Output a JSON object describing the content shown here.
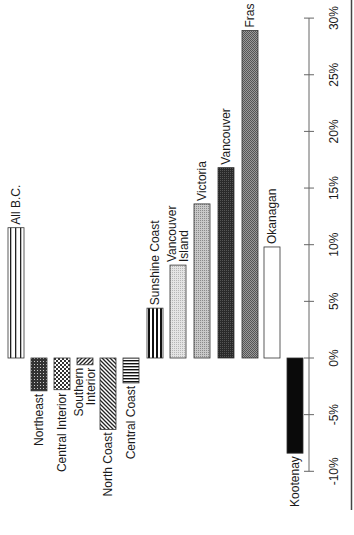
{
  "chart_data": {
    "type": "bar",
    "orientation": "rotated-90-ccw",
    "title": "",
    "xlabel": "",
    "ylabel": "",
    "ylim": [
      -10,
      30
    ],
    "grid": false,
    "legend": "none (bars labeled directly)",
    "yticks": [
      "-10%",
      "-5%",
      "0%",
      "5%",
      "10%",
      "15%",
      "20%",
      "25%",
      "30%"
    ],
    "categories": [
      "All B.C.",
      "Northeast",
      "Central Interior",
      "Southern Interior",
      "North Coast",
      "Central Coast",
      "Sunshine Coast",
      "Vancouver Island",
      "Victoria",
      "Vancouver",
      "Fras",
      "Okanagan",
      "Kootenay"
    ],
    "values": [
      11.5,
      -2.9,
      -2.8,
      -0.6,
      -6.3,
      -2.2,
      4.4,
      8.2,
      13.6,
      16.8,
      28.9,
      9.8,
      -8.4
    ]
  },
  "bars": [
    {
      "label": "All B.C.",
      "lines": [
        "All B.C."
      ],
      "value": 11.5,
      "x": 8,
      "pattern": "vstripes-wide"
    },
    {
      "label": "Northeast",
      "lines": [
        "Northeast"
      ],
      "value": -2.9,
      "x": 31,
      "pattern": "dense-dots"
    },
    {
      "label": "Central Interior",
      "lines": [
        "Central Interior"
      ],
      "value": -2.8,
      "x": 54,
      "pattern": "checker"
    },
    {
      "label": "Southern Interior",
      "lines": [
        "Southern",
        "Interior"
      ],
      "value": -0.6,
      "x": 77,
      "pattern": "diag-right"
    },
    {
      "label": "North Coast",
      "lines": [
        "North Coast"
      ],
      "value": -6.3,
      "x": 100,
      "pattern": "diag-left"
    },
    {
      "label": "Central Coast",
      "lines": [
        "Central Coast"
      ],
      "value": -2.2,
      "x": 123,
      "pattern": "hstripes"
    },
    {
      "label": "Sunshine Coast",
      "lines": [
        "Sunshine Coast"
      ],
      "value": 4.4,
      "x": 147,
      "pattern": "vstripes-bold"
    },
    {
      "label": "Vancouver Island",
      "lines": [
        "Vancouver",
        "Island"
      ],
      "value": 8.2,
      "x": 170,
      "pattern": "light-gray"
    },
    {
      "label": "Victoria",
      "lines": [
        "Victoria"
      ],
      "value": 13.6,
      "x": 194,
      "pattern": "mid-gray"
    },
    {
      "label": "Vancouver",
      "lines": [
        "Vancouver"
      ],
      "value": 16.8,
      "x": 218,
      "pattern": "dark"
    },
    {
      "label": "Fras",
      "lines": [
        "Fras"
      ],
      "value": 28.9,
      "x": 242,
      "pattern": "dark-gray"
    },
    {
      "label": "Okanagan",
      "lines": [
        "Okanagan"
      ],
      "value": 9.8,
      "x": 264,
      "pattern": "white"
    },
    {
      "label": "Kootenay",
      "lines": [
        "Kootenay"
      ],
      "value": -8.4,
      "x": 287,
      "pattern": "black"
    }
  ],
  "axis": {
    "ticks": [
      {
        "value": 30,
        "label": "30%"
      },
      {
        "value": 25,
        "label": "25%"
      },
      {
        "value": 20,
        "label": "20%"
      },
      {
        "value": 15,
        "label": "15%"
      },
      {
        "value": 10,
        "label": "10%"
      },
      {
        "value": 5,
        "label": "5%"
      },
      {
        "value": 0,
        "label": "0%"
      },
      {
        "value": -5,
        "label": "-5%"
      },
      {
        "value": -10,
        "label": "-10%"
      }
    ]
  }
}
